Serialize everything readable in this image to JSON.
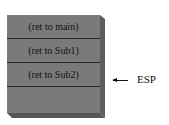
{
  "diagram": {
    "type": "stack",
    "cells": [
      {
        "label": "(ret to main)"
      },
      {
        "label": "(ret to Sub1)"
      },
      {
        "label": "(ret to Sub2)"
      },
      {
        "label": ""
      }
    ],
    "pointer": {
      "label": "ESP",
      "points_to_index": 2
    }
  }
}
